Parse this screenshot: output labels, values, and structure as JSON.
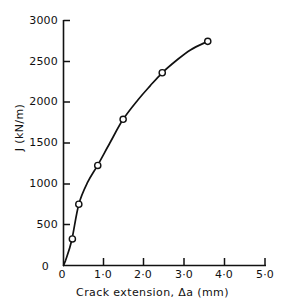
{
  "chart_data": {
    "type": "line",
    "title": "",
    "subtitle": "",
    "xlabel": "Crack extension, Δa (mm)",
    "ylabel": "J (kN/m)",
    "xlim": [
      0,
      5.0
    ],
    "ylim": [
      0,
      3000
    ],
    "grid": false,
    "legend": null,
    "xticks": [
      0,
      1.0,
      2.0,
      3.0,
      4.0,
      5.0
    ],
    "xtick_labels": [
      "0",
      "1·0",
      "2·0",
      "3·0",
      "4·0",
      "5·0"
    ],
    "yticks": [
      0,
      500,
      1000,
      1500,
      2000,
      2500,
      3000
    ],
    "ytick_labels": [
      "0",
      "500",
      "1000",
      "1500",
      "2000",
      "2500",
      "3000"
    ],
    "marker": "open-circle",
    "line_color": "#111111",
    "marker_color": "#111111",
    "series": [
      {
        "name": "J-R curve",
        "x": [
          0.22,
          0.38,
          0.85,
          1.48,
          2.45,
          3.58
        ],
        "values": [
          325,
          750,
          1225,
          1790,
          2360,
          2745
        ]
      }
    ],
    "curve_x": [
      0.05,
      0.2,
      0.38,
      0.6,
      0.85,
      1.15,
      1.48,
      1.85,
      2.15,
      2.45,
      2.8,
      3.15,
      3.58
    ],
    "curve_y": [
      60,
      300,
      750,
      1020,
      1230,
      1500,
      1790,
      2030,
      2200,
      2360,
      2510,
      2640,
      2745
    ]
  },
  "axes": {
    "x_axis_name": "x-axis",
    "y_axis_name": "y-axis"
  }
}
